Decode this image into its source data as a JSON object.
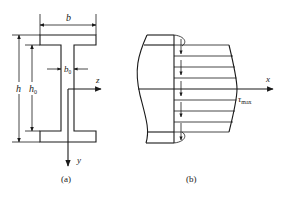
{
  "figure_a": {
    "caption": "(a)",
    "labels": {
      "width": "b",
      "height": "h",
      "web_height": "h",
      "web_height_sub": "0",
      "web_thickness": "b",
      "web_thickness_sub": "0",
      "z_axis": "z",
      "y_axis": "y"
    }
  },
  "figure_b": {
    "caption": "(b)",
    "labels": {
      "x_axis": "x",
      "shear_stress": "τ",
      "shear_stress_sub": "max"
    }
  },
  "colors": {
    "stroke": "#1a1a1a",
    "background": "#ffffff"
  }
}
